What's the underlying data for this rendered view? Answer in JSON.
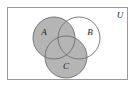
{
  "figure": {
    "kind": "venn-diagram",
    "width": 136,
    "height": 89,
    "background_color": "#ffffff"
  },
  "universe": {
    "label": "U",
    "label_x": 120,
    "label_y": 16,
    "frame": {
      "x": 7.5,
      "y": 7.5,
      "width": 120,
      "height": 72,
      "stroke_color": "#9a9a9a",
      "stroke_width": 1,
      "fill_color": "#ffffff"
    }
  },
  "shading": {
    "shaded_color": "#b5b5b5",
    "unshaded_color": "#ffffff",
    "description": "A union C shaded; B unshaded except where it meets A or C",
    "stroke_color": "#6e6e6e",
    "stroke_width": 0.9
  },
  "sets": [
    {
      "id": "A",
      "label": "A",
      "cx": 54,
      "cy": 38,
      "r": 21,
      "shaded": true,
      "label_x": 44,
      "label_y": 33
    },
    {
      "id": "B",
      "label": "B",
      "cx": 79,
      "cy": 38,
      "r": 21,
      "shaded": false,
      "label_x": 90,
      "label_y": 33
    },
    {
      "id": "C",
      "label": "C",
      "cx": 66,
      "cy": 57,
      "r": 21,
      "shaded": true,
      "label_x": 66,
      "label_y": 67
    }
  ]
}
